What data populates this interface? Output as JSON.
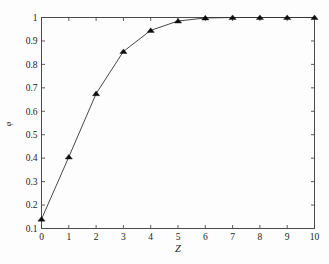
{
  "chart_data": {
    "type": "line",
    "title": "",
    "subtitle": "",
    "xlabel": "Z",
    "ylabel": "φ",
    "xlim": [
      0,
      10
    ],
    "ylim": [
      0.1,
      1
    ],
    "grid": false,
    "legend": null,
    "marker": "filled-triangle",
    "line_color": "#333333",
    "marker_color": "#0d0d0d",
    "axis_color": "#4a4a4a",
    "background_color": "#fdfdfd",
    "x": [
      0,
      1,
      2,
      3,
      4,
      5,
      6,
      7,
      8,
      9,
      10
    ],
    "values": [
      0.14,
      0.405,
      0.675,
      0.855,
      0.945,
      0.985,
      0.998,
      1.0,
      1.0,
      1.0,
      1.0
    ],
    "series": [
      {
        "name": "phi",
        "x": [
          0,
          1,
          2,
          3,
          4,
          5,
          6,
          7,
          8,
          9,
          10
        ],
        "values": [
          0.14,
          0.405,
          0.675,
          0.855,
          0.945,
          0.985,
          0.998,
          1.0,
          1.0,
          1.0,
          1.0
        ]
      }
    ],
    "xticks": [
      0,
      1,
      2,
      3,
      4,
      5,
      6,
      7,
      8,
      9,
      10
    ],
    "xtick_labels": [
      "0",
      "1",
      "2",
      "3",
      "4",
      "5",
      "6",
      "7",
      "8",
      "9",
      "10"
    ],
    "yticks": [
      0.1,
      0.2,
      0.3,
      0.4,
      0.5,
      0.6,
      0.7,
      0.8,
      0.9,
      1.0
    ],
    "ytick_labels": [
      "0.1",
      "0.2",
      "0.3",
      "0.4",
      "0.5",
      "0.6",
      "0.7",
      "0.8",
      "0.9",
      "1"
    ],
    "annotations": []
  }
}
